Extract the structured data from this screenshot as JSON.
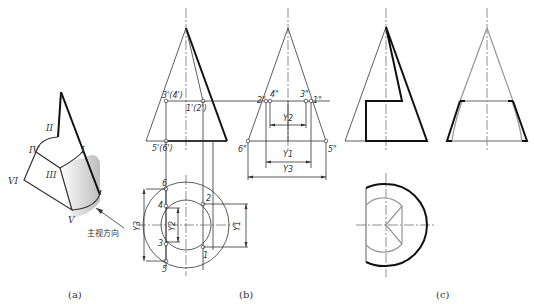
{
  "figure": {
    "panels": [
      {
        "id": "a",
        "caption": "(a)"
      },
      {
        "id": "b",
        "caption": "(b)"
      },
      {
        "id": "c",
        "caption": "(c)"
      }
    ],
    "panel_a": {
      "roman_labels": [
        "I",
        "II",
        "III",
        "IV",
        "V",
        "VI"
      ],
      "view_direction_label": "主视方向"
    },
    "panel_b": {
      "front_labels": {
        "p34": "3'(4')",
        "p12": "1'(2')",
        "p56": "5'(6')"
      },
      "side_labels": {
        "p2": "2\"",
        "p4": "4\"",
        "p3": "3\"",
        "p1": "1\"",
        "p6": "6\"",
        "p5": "5\""
      },
      "top_labels": {
        "p6": "6",
        "p4": "4",
        "p3": "3",
        "p5": "5",
        "p2": "2",
        "p1": "1"
      },
      "dimensions": {
        "y1": "Y1",
        "y2": "Y2",
        "y3": "Y3"
      }
    },
    "colors": {
      "line": "#333333",
      "bold": "#111111",
      "hidden": "#9a9a9a",
      "shade": "#cfcfcf"
    }
  }
}
